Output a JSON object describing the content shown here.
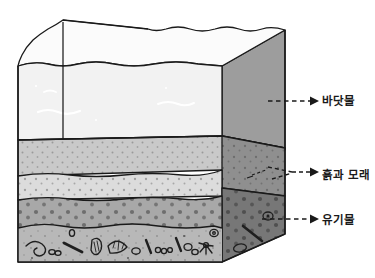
{
  "figure": {
    "container_shape": "3d-box-with-wavy-water-surface",
    "layers": [
      {
        "id": "seawater",
        "label": "바닷물",
        "front_fill": "#f2f2f2",
        "side_fill": "#9d9d9d",
        "top_fill": "#fbfbfb",
        "texture": "white-wavy-current-lines"
      },
      {
        "id": "soil-sand",
        "label": "흙과 모래",
        "front_fill": "#dcdcdc",
        "side_fill": "#8f8f8f",
        "top_fill": "#c9c9c9",
        "texture": "fine-speckled-dots"
      },
      {
        "id": "organic",
        "label": "유기물",
        "front_fill": "#a8a8a8",
        "side_fill": "#777777",
        "debris_band_fill": "#b8b8b8",
        "texture": "coarse-dots-and-organic-debris"
      }
    ],
    "callouts": [
      {
        "id": "callout-seawater",
        "label": "바닷물",
        "arrow": "dashed-right-arrow",
        "branches": 1
      },
      {
        "id": "callout-soil-sand",
        "label": "흙과 모래",
        "arrow": "dashed-right-arrow",
        "branches": 2
      },
      {
        "id": "callout-organic",
        "label": "유기물",
        "arrow": "dashed-right-arrow",
        "branches": 1
      }
    ],
    "debris_items": [
      "worm",
      "pellets",
      "twig",
      "seed",
      "ribbed-shell",
      "clam-shell",
      "oval",
      "stick",
      "bead-chain",
      "pebbles",
      "starburst",
      "spiral"
    ],
    "caption": ""
  },
  "colors": {
    "outline": "#1a1a1a",
    "label": "#1a1a1a",
    "background": "#ffffff"
  }
}
